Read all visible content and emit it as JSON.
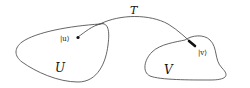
{
  "diagram": {
    "colors": {
      "stroke": "#555555",
      "point": "#111111",
      "background": "#ffffff"
    },
    "labels": {
      "path": "T",
      "region_left": "U",
      "region_right": "V",
      "state_u": "|u⟩",
      "state_v": "|v⟩"
    }
  }
}
